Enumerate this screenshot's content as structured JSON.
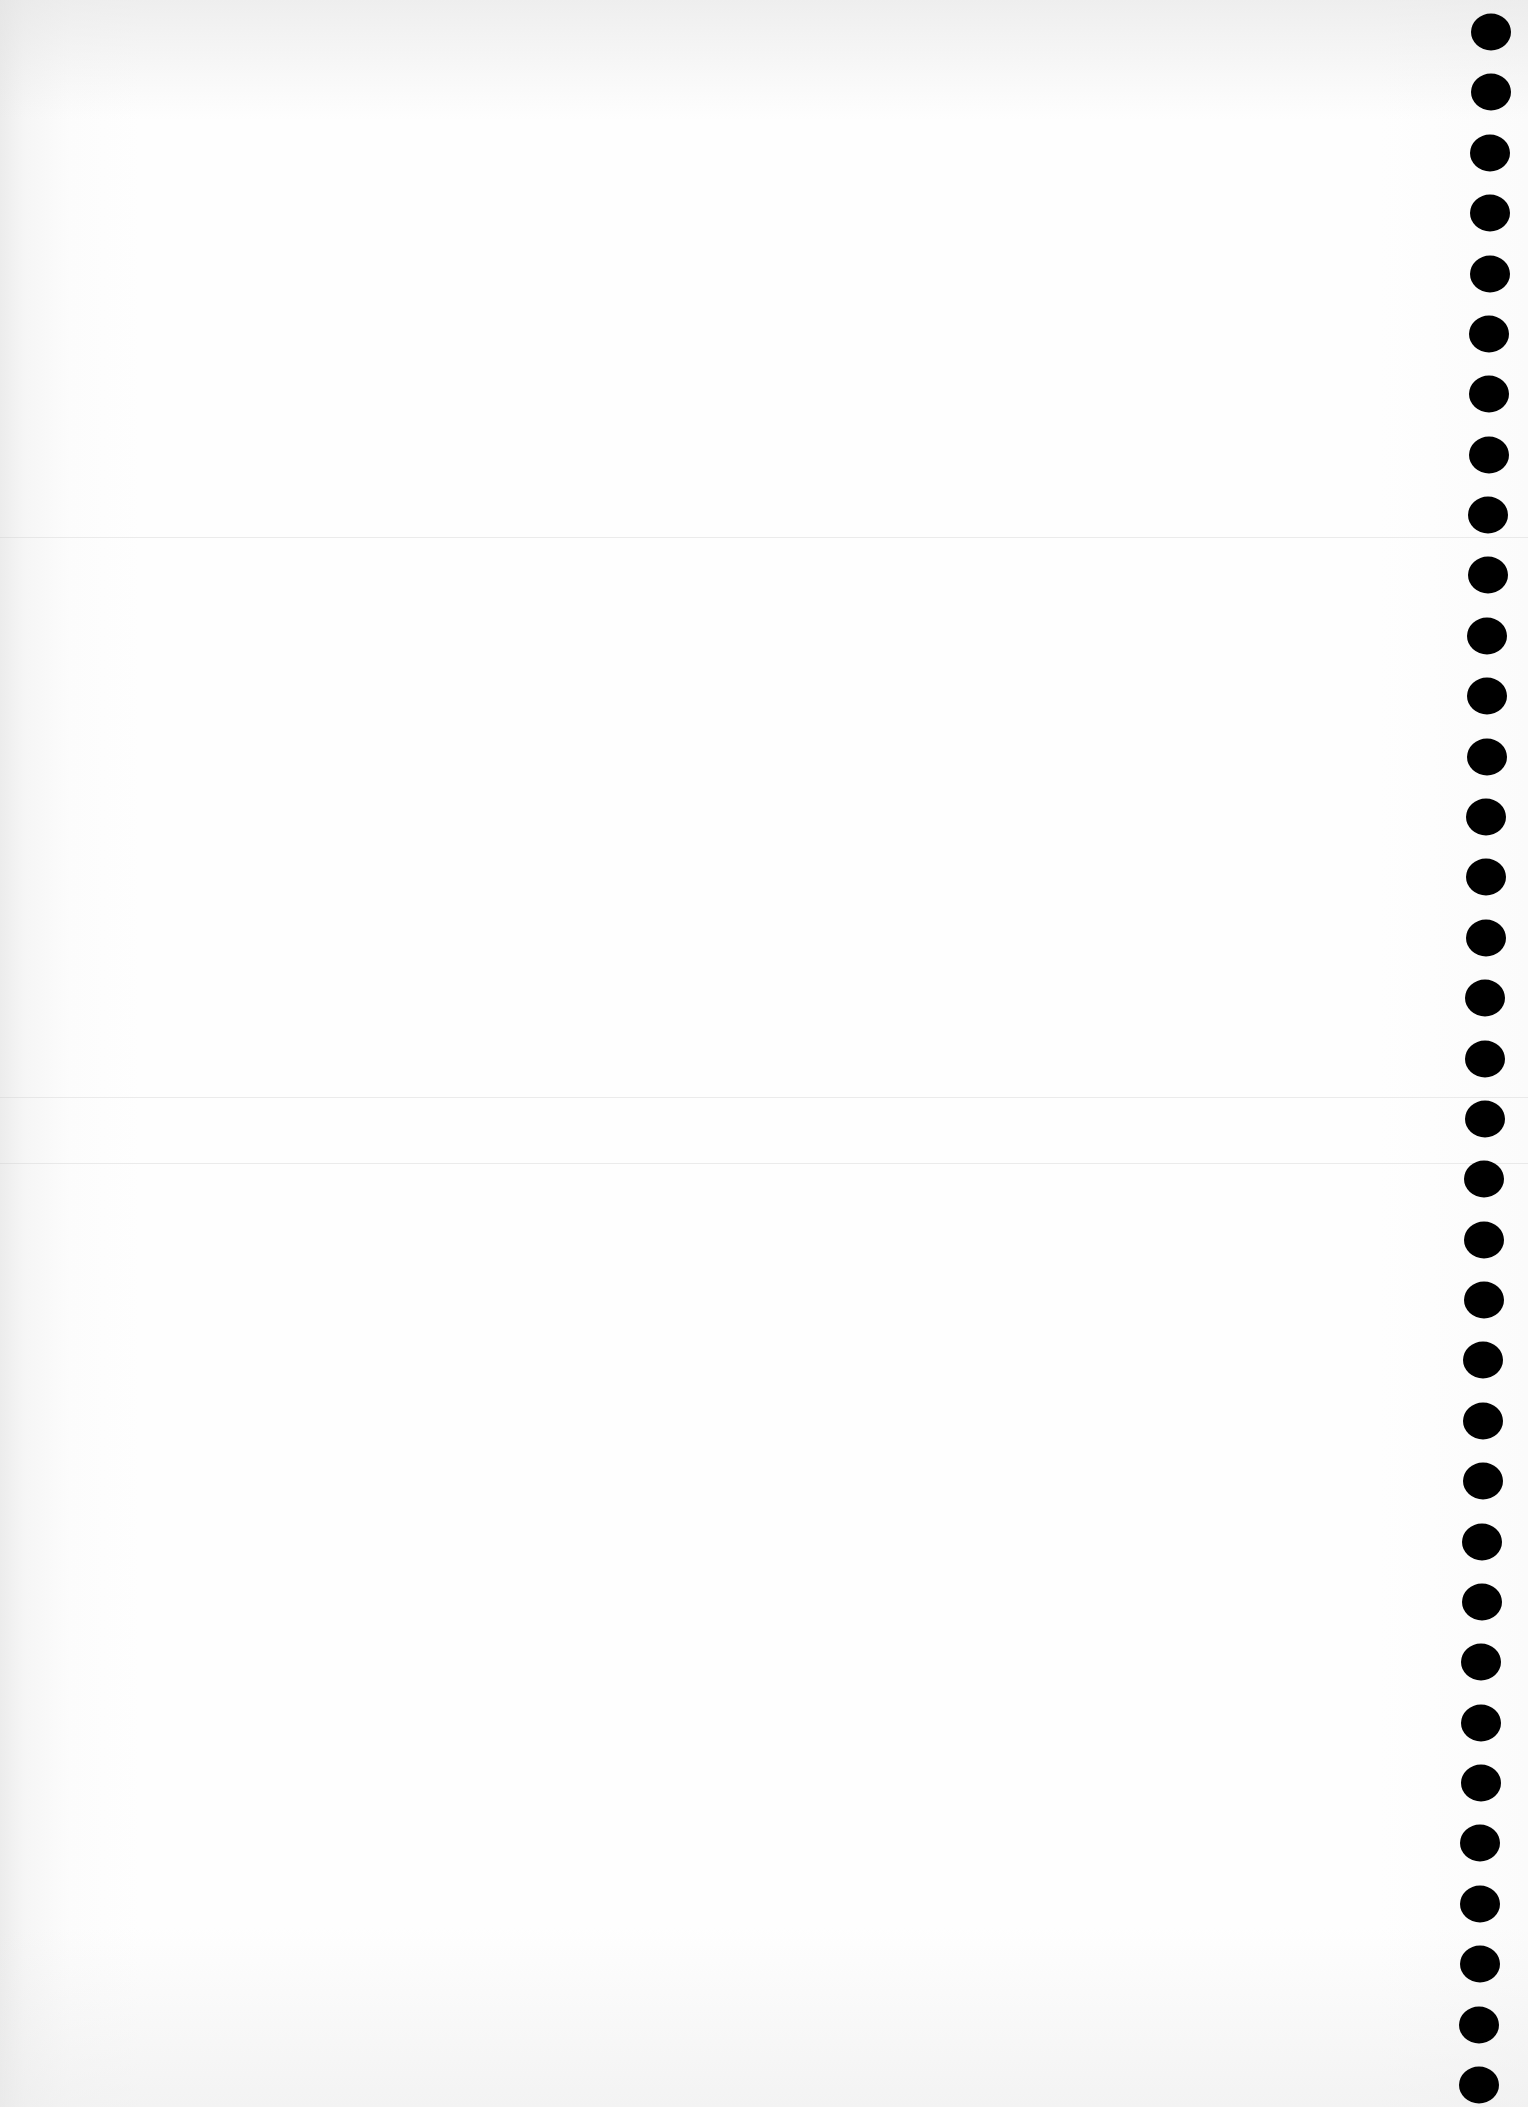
{
  "document": {
    "type": "blank punched sheet",
    "text_content": "",
    "background_color": "#fefefe",
    "hole_color": "#000000",
    "fold_lines_y": [
      537,
      1097,
      1163
    ],
    "punch_holes": {
      "count": 35,
      "first_center": {
        "x": 1491,
        "y": 32
      },
      "last_center": {
        "x": 1479,
        "y": 2085
      },
      "diameter_px": 40
    }
  }
}
